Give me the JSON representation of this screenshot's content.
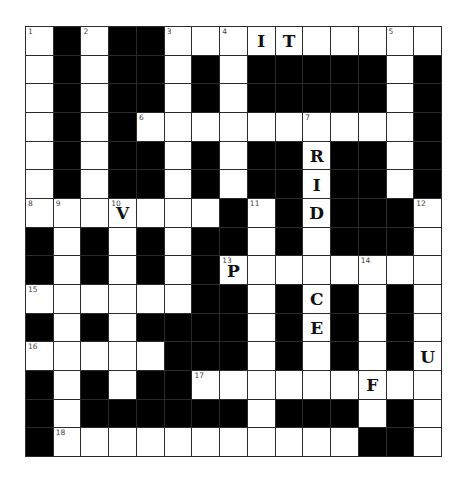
{
  "puzzle": {
    "rows": 15,
    "cols": 15,
    "grid": [
      ".#.##..ITzzzz..",
      ".#.##.#.#####.#",
      ".#.##.#.#####.#",
      ".#.#.........#",
      ".#.##.#.##R##.#",
      ".#.##.#.##I##.#",
      "...V...#.#D###.",
      "#.#.#.##.#.###.",
      "#.#.#.#P.......",
      "......##.#C#.#.",
      "#.#.####.#E#.#.",
      ".....###.#.#.#U",
      "#.#.##.....F..",
      "#.######.###.#.",
      "#...........##."
    ],
    "cells": [
      [
        "W",
        "B",
        "W",
        "B",
        "B",
        "W",
        "W",
        "W",
        "I",
        "T",
        "W",
        "W",
        "W",
        "W",
        "W"
      ],
      [
        "W",
        "B",
        "W",
        "B",
        "B",
        "W",
        "B",
        "W",
        "B",
        "B",
        "B",
        "B",
        "B",
        "W",
        "B"
      ],
      [
        "W",
        "B",
        "W",
        "B",
        "B",
        "W",
        "B",
        "W",
        "B",
        "B",
        "B",
        "B",
        "B",
        "W",
        "B"
      ],
      [
        "W",
        "B",
        "W",
        "B",
        "W",
        "W",
        "W",
        "W",
        "W",
        "W",
        "W",
        "W",
        "W",
        "W",
        "B"
      ],
      [
        "W",
        "B",
        "W",
        "B",
        "B",
        "W",
        "B",
        "W",
        "B",
        "B",
        "R",
        "B",
        "B",
        "W",
        "B"
      ],
      [
        "W",
        "B",
        "W",
        "B",
        "B",
        "W",
        "B",
        "W",
        "B",
        "B",
        "I",
        "B",
        "B",
        "W",
        "B"
      ],
      [
        "W",
        "W",
        "W",
        "V",
        "W",
        "W",
        "W",
        "B",
        "W",
        "B",
        "D",
        "B",
        "B",
        "B",
        "W"
      ],
      [
        "B",
        "W",
        "B",
        "W",
        "B",
        "W",
        "B",
        "B",
        "W",
        "B",
        "W",
        "B",
        "B",
        "B",
        "W"
      ],
      [
        "B",
        "W",
        "B",
        "W",
        "B",
        "W",
        "B",
        "P",
        "W",
        "W",
        "W",
        "W",
        "W",
        "W",
        "W"
      ],
      [
        "W",
        "W",
        "W",
        "W",
        "W",
        "W",
        "B",
        "B",
        "W",
        "B",
        "C",
        "B",
        "W",
        "B",
        "W"
      ],
      [
        "B",
        "W",
        "B",
        "W",
        "B",
        "B",
        "B",
        "B",
        "W",
        "B",
        "E",
        "B",
        "W",
        "B",
        "W"
      ],
      [
        "W",
        "W",
        "W",
        "W",
        "W",
        "B",
        "B",
        "B",
        "W",
        "B",
        "W",
        "B",
        "W",
        "B",
        "U"
      ],
      [
        "B",
        "W",
        "B",
        "W",
        "B",
        "B",
        "W",
        "W",
        "W",
        "W",
        "W",
        "W",
        "F",
        "W",
        "W"
      ],
      [
        "B",
        "W",
        "B",
        "B",
        "B",
        "B",
        "B",
        "B",
        "W",
        "B",
        "B",
        "B",
        "W",
        "B",
        "W"
      ],
      [
        "B",
        "W",
        "W",
        "W",
        "W",
        "W",
        "W",
        "W",
        "W",
        "W",
        "W",
        "W",
        "B",
        "B",
        "W"
      ]
    ],
    "numbers": [
      {
        "n": "1",
        "row": 0,
        "col": 0
      },
      {
        "n": "2",
        "row": 0,
        "col": 2
      },
      {
        "n": "3",
        "row": 0,
        "col": 5
      },
      {
        "n": "4",
        "row": 0,
        "col": 7
      },
      {
        "n": "5",
        "row": 0,
        "col": 13
      },
      {
        "n": "6",
        "row": 3,
        "col": 4
      },
      {
        "n": "7",
        "row": 3,
        "col": 10
      },
      {
        "n": "8",
        "row": 6,
        "col": 0
      },
      {
        "n": "9",
        "row": 6,
        "col": 1
      },
      {
        "n": "10",
        "row": 6,
        "col": 3
      },
      {
        "n": "11",
        "row": 6,
        "col": 8
      },
      {
        "n": "12",
        "row": 6,
        "col": 14
      },
      {
        "n": "13",
        "row": 8,
        "col": 7
      },
      {
        "n": "14",
        "row": 8,
        "col": 12
      },
      {
        "n": "15",
        "row": 9,
        "col": 0
      },
      {
        "n": "16",
        "row": 11,
        "col": 0
      },
      {
        "n": "17",
        "row": 12,
        "col": 6
      },
      {
        "n": "18",
        "row": 14,
        "col": 1
      }
    ],
    "colors": {
      "block": "#000000",
      "empty": "#ffffff",
      "line": "#2b2b2b"
    }
  }
}
